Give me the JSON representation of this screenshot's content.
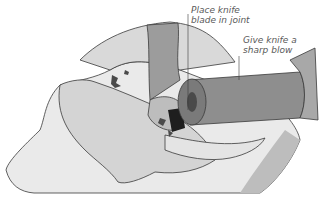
{
  "illustration": {
    "subject": "Cutting a chicken joint with a knife and mallet",
    "annotations": [
      {
        "line1": "Place knife",
        "line2": "blade in joint"
      },
      {
        "line1": "Give knife a",
        "line2": "sharp blow"
      }
    ]
  },
  "colors": {
    "background": "#ffffff",
    "outline": "#3a3a3a",
    "board": "#e6e6e6",
    "chicken": "#d8d8d8",
    "arm": "#9a9a9a",
    "mallet": "#8a8a8a",
    "dark": "#222222",
    "label": "#5a5a5a"
  }
}
